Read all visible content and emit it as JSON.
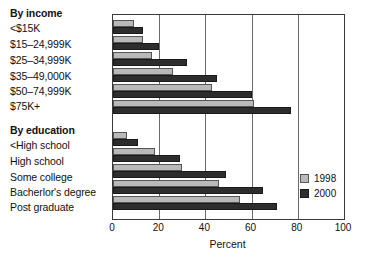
{
  "chart_data": {
    "type": "bar",
    "orientation": "horizontal",
    "title": "",
    "xlabel": "Percent",
    "ylabel": "",
    "xlim": [
      0,
      100
    ],
    "xticks": [
      0,
      20,
      40,
      60,
      80,
      100
    ],
    "grid": true,
    "grid_axis": "x",
    "legend_position": "right-inside",
    "groups": [
      {
        "heading": "By income",
        "categories": [
          "<$15K",
          "$15–24,999K",
          "$25–34,999K",
          "$35–49,000K",
          "$50–74,999K",
          "$75K+"
        ],
        "series": [
          {
            "name": "1998",
            "values": [
              9,
              13,
              17,
              26,
              43,
              61
            ]
          },
          {
            "name": "2000",
            "values": [
              13,
              20,
              32,
              45,
              60,
              77
            ]
          }
        ]
      },
      {
        "heading": "By education",
        "categories": [
          "<High school",
          "High school",
          "Some college",
          "Bacherlor's degree",
          "Post graduate"
        ],
        "series": [
          {
            "name": "1998",
            "values": [
              6,
              18,
              30,
              46,
              55
            ]
          },
          {
            "name": "2000",
            "values": [
              11,
              29,
              49,
              65,
              71
            ]
          }
        ]
      }
    ],
    "legend": [
      {
        "label": "1998",
        "color": "#b9b9b9"
      },
      {
        "label": "2000",
        "color": "#2d2d2d"
      }
    ],
    "colors": {
      "series_1998": "#b9b9b9",
      "series_2000": "#2d2d2d",
      "axis": "#3a3a3a",
      "grid": "#6a6a6a",
      "background": "#ffffff",
      "text": "#111111"
    }
  }
}
